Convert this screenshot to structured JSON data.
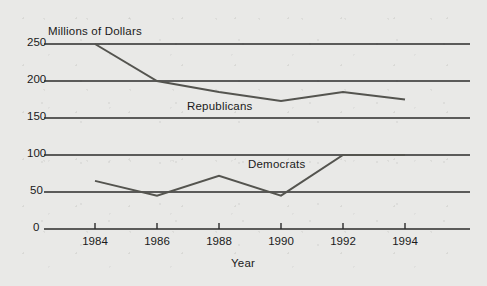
{
  "figure": {
    "background_color": "#e9e9e7",
    "line_color": "#54544f",
    "axis_color": "#2b2b2b",
    "text_color": "#1a1a1a"
  },
  "chart_data": {
    "type": "line",
    "title": "",
    "xlabel": "Year",
    "ylabel": "Millions of Dollars",
    "categories": [
      "1984",
      "1986",
      "1988",
      "1990",
      "1992",
      "1994"
    ],
    "x": [
      1984,
      1986,
      1988,
      1990,
      1992,
      1994
    ],
    "xlim": [
      1983,
      1995.5
    ],
    "ylim": [
      0,
      262
    ],
    "yticks": [
      0,
      50,
      100,
      150,
      200,
      250
    ],
    "ytick_labels": [
      "0",
      "50",
      "100",
      "150",
      "200",
      "250"
    ],
    "grid": true,
    "grid_axis": "y",
    "legend": "inline-labels",
    "series": [
      {
        "name": "Republicans",
        "values": [
          250,
          200,
          185,
          173,
          185,
          175
        ],
        "label_position": "above-line-between-1986-and-1990"
      },
      {
        "name": "Democrats",
        "values": [
          65,
          45,
          72,
          45,
          100,
          100
        ],
        "label_position": "above-line-between-1988-and-1990"
      }
    ]
  },
  "axes": {
    "y_title": "Millions of Dollars",
    "x_title": "Year"
  }
}
